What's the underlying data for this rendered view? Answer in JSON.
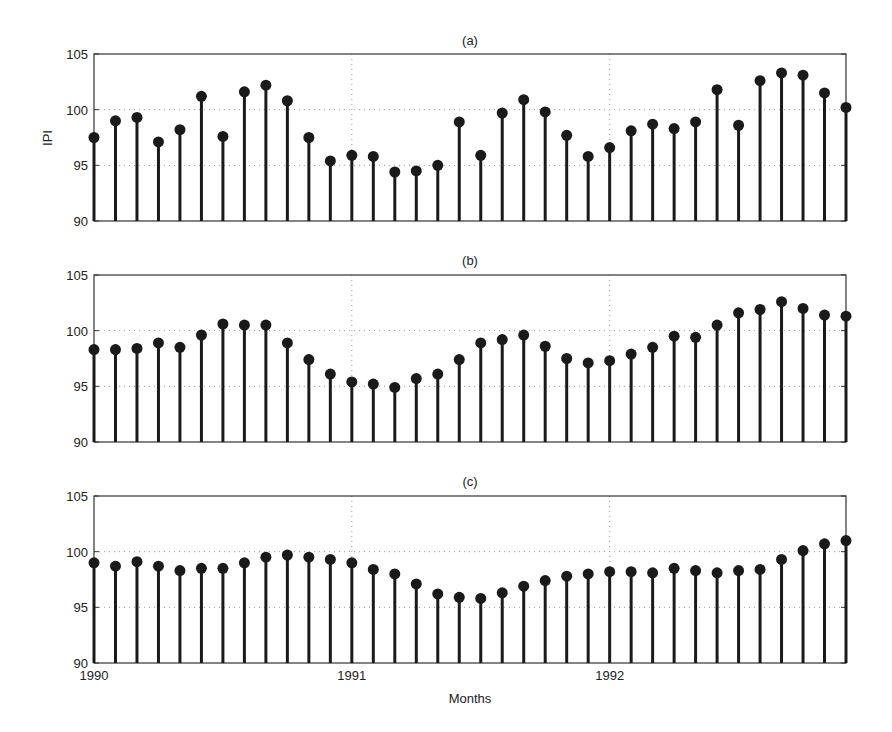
{
  "chart_data": [
    {
      "type": "stem",
      "title": "(a)",
      "xlabel": "",
      "ylabel": "IPI",
      "ylim": [
        90,
        105
      ],
      "yticks": [
        "90",
        "95",
        "100",
        "105"
      ],
      "grid": true,
      "xlim_index": [
        0,
        35
      ],
      "values": [
        97.5,
        99.0,
        99.3,
        97.1,
        98.2,
        101.2,
        97.6,
        101.6,
        102.2,
        100.8,
        97.5,
        95.4,
        95.9,
        95.8,
        94.4,
        94.5,
        95.0,
        98.9,
        95.9,
        99.7,
        100.9,
        99.8,
        97.7,
        95.8,
        96.6,
        98.1,
        98.7,
        98.3,
        98.9,
        101.8,
        98.6,
        102.6,
        103.3,
        103.1,
        101.5,
        100.2
      ]
    },
    {
      "type": "stem",
      "title": "(b)",
      "xlabel": "",
      "ylabel": "",
      "ylim": [
        90,
        105
      ],
      "yticks": [
        "90",
        "95",
        "100",
        "105"
      ],
      "grid": true,
      "values": [
        98.3,
        98.3,
        98.4,
        98.9,
        98.5,
        99.6,
        100.6,
        100.5,
        100.5,
        98.9,
        97.4,
        96.1,
        95.4,
        95.2,
        94.9,
        95.7,
        96.1,
        97.4,
        98.9,
        99.2,
        99.6,
        98.6,
        97.5,
        97.1,
        97.3,
        97.9,
        98.5,
        99.5,
        99.4,
        100.5,
        101.6,
        101.9,
        102.6,
        102.0,
        101.4,
        101.3
      ]
    },
    {
      "type": "stem",
      "title": "(c)",
      "xlabel": "Months",
      "ylabel": "",
      "ylim": [
        90,
        105
      ],
      "yticks": [
        "90",
        "95",
        "100",
        "105"
      ],
      "grid": true,
      "xticks": [
        {
          "index": 0,
          "label": "1990"
        },
        {
          "index": 12,
          "label": "1991"
        },
        {
          "index": 24,
          "label": "1992"
        }
      ],
      "values": [
        99.0,
        98.7,
        99.1,
        98.7,
        98.3,
        98.5,
        98.5,
        99.0,
        99.5,
        99.7,
        99.5,
        99.3,
        99.0,
        98.4,
        98.0,
        97.1,
        96.2,
        95.9,
        95.8,
        96.3,
        96.9,
        97.4,
        97.8,
        98.0,
        98.2,
        98.2,
        98.1,
        98.5,
        98.3,
        98.1,
        98.3,
        98.4,
        99.3,
        100.1,
        100.7,
        101.0
      ]
    }
  ]
}
